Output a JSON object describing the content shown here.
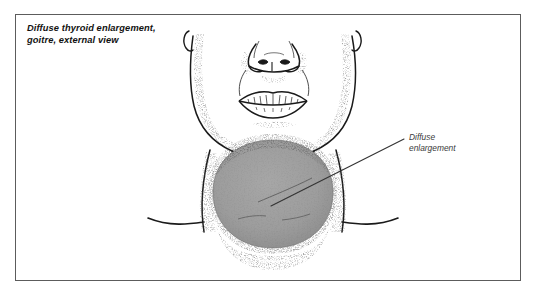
{
  "figure": {
    "title": "Diffuse thyroid enlargement,\ngoitre, external view",
    "type": "medical-anatomical-line-illustration",
    "frame": {
      "border_color": "#5c5c5c",
      "background_color": "#ffffff"
    },
    "colors": {
      "ink": "#1a1a1a",
      "goitre_fill": "#9e9e9e",
      "goitre_shadow": "#8d8d8d",
      "stipple": "#2a2a2a",
      "leader_line": "#333333",
      "label_text": "#3a3a3a",
      "title_text": "#111111"
    },
    "callouts": [
      {
        "id": "diffuse-enlargement",
        "label": "Diffuse\nenlargement",
        "target": "goitre mass on anterior neck"
      }
    ],
    "anatomy_parts": [
      "nose",
      "lips",
      "chin",
      "jawline",
      "left ear",
      "right ear",
      "neck",
      "left clavicle",
      "right clavicle",
      "thyroid goitre swelling"
    ]
  }
}
